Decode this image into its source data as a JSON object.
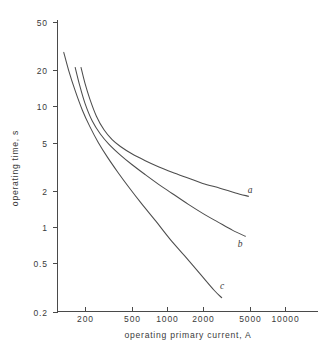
{
  "chart_data": {
    "type": "line",
    "title": "",
    "xlabel": "operating primary current, A",
    "ylabel": "operating time, s",
    "xscale": "log",
    "yscale": "log",
    "xlim": [
      130,
      16000
    ],
    "ylim": [
      0.2,
      60
    ],
    "grid": false,
    "legend_position": "inline-right-of-curve-ends",
    "xticks": [
      200,
      500,
      1000,
      2000,
      5000,
      10000
    ],
    "xticklabels": [
      "200",
      "500",
      "1000",
      "2000",
      "5000",
      "10000"
    ],
    "yticks": [
      50,
      20,
      10,
      5,
      2,
      1,
      0.5,
      0.2
    ],
    "yticklabels": [
      "50",
      "20",
      "10",
      "5",
      "2",
      "1",
      "0.5",
      "0.2"
    ],
    "series": [
      {
        "name": "a",
        "label": "a",
        "x": [
          185,
          200,
          220,
          250,
          290,
          340,
          400,
          500,
          650,
          850,
          1100,
          1500,
          2000,
          2800,
          3800,
          4900
        ],
        "y": [
          21.0,
          15.5,
          11.5,
          8.3,
          6.4,
          5.3,
          4.65,
          4.05,
          3.55,
          3.15,
          2.85,
          2.55,
          2.3,
          2.1,
          1.92,
          1.8
        ]
      },
      {
        "name": "b",
        "label": "b",
        "x": [
          165,
          180,
          200,
          230,
          270,
          320,
          400,
          500,
          650,
          850,
          1100,
          1500,
          2000,
          2700,
          3600,
          4600
        ],
        "y": [
          21.0,
          15.0,
          10.6,
          7.6,
          5.9,
          4.85,
          3.95,
          3.3,
          2.72,
          2.25,
          1.9,
          1.55,
          1.3,
          1.1,
          0.94,
          0.84
        ]
      },
      {
        "name": "c",
        "label": "c",
        "x": [
          132,
          145,
          165,
          190,
          220,
          260,
          310,
          380,
          470,
          600,
          800,
          1050,
          1400,
          1900,
          2500,
          2900
        ],
        "y": [
          28.0,
          20.0,
          13.5,
          9.3,
          6.8,
          5.0,
          3.8,
          2.85,
          2.15,
          1.58,
          1.12,
          0.8,
          0.58,
          0.41,
          0.3,
          0.26
        ]
      }
    ],
    "curve_labels": [
      {
        "text": "a",
        "x_px": 250,
        "y_px": 193
      },
      {
        "text": "b",
        "x_px": 240,
        "y_px": 247
      },
      {
        "text": "c",
        "x_px": 222,
        "y_px": 289
      }
    ]
  }
}
